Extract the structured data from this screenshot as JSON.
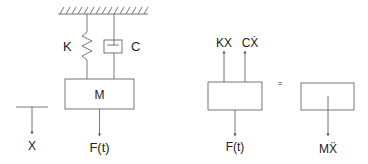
{
  "diagram": {
    "type": "spring-mass-damper free body diagram",
    "colors": {
      "line": "#555555",
      "text": "#222222",
      "background": "#ffffff"
    },
    "system": {
      "spring_label": "K",
      "damper_label": "C",
      "mass_label": "M",
      "force_label": "F(t)",
      "displacement_label": "X"
    },
    "free_body": {
      "spring_force_label": "KX",
      "damper_force_label": "CẊ",
      "applied_force_label": "F(t)",
      "equals_sign": "=",
      "inertia_label": "MẌ"
    }
  }
}
